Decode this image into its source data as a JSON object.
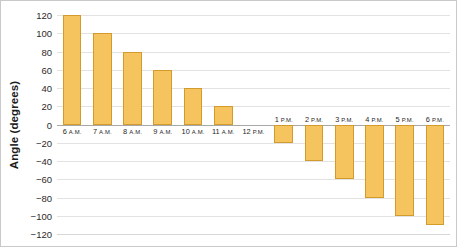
{
  "chart_data": {
    "type": "bar",
    "title": "",
    "xlabel": "",
    "ylabel": "Angle (degrees)",
    "ylim": [
      -120,
      120
    ],
    "ytick_step": 20,
    "grid": true,
    "legend": "none",
    "categories": [
      "6 A.M.",
      "7 A.M.",
      "8 A.M.",
      "9 A.M.",
      "10 A.M.",
      "11 A.M.",
      "12 P.M.",
      "1 P.M.",
      "2 P.M.",
      "3 P.M.",
      "4 P.M.",
      "5 P.M.",
      "6 P.M."
    ],
    "values": [
      120,
      100,
      80,
      60,
      40,
      20,
      0,
      -20,
      -40,
      -60,
      -80,
      -100,
      -110
    ],
    "ytick_labels": [
      "120",
      "100",
      "80",
      "60",
      "40",
      "20",
      "0",
      "−20",
      "−40",
      "−60",
      "−80",
      "−100",
      "−120"
    ],
    "ytick_values": [
      120,
      100,
      80,
      60,
      40,
      20,
      0,
      -20,
      -40,
      -60,
      -80,
      -100,
      -120
    ],
    "bar_color": "#f6c45e",
    "bar_border_color": "#d39a2c",
    "grid_color": "#e2e2e2",
    "axis_color": "#a8a8a8",
    "background": "#ffffff"
  }
}
